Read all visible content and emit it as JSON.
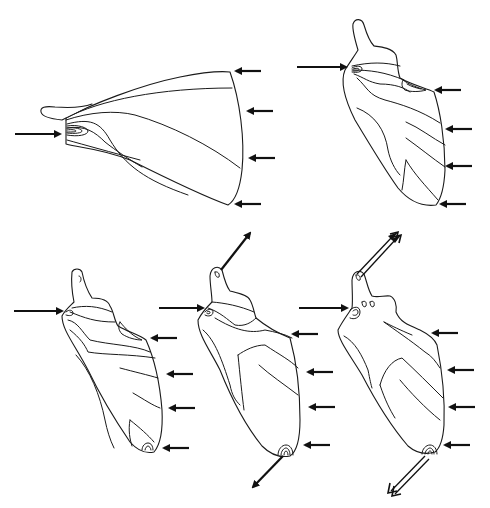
{
  "diagram": {
    "type": "line-art illustration",
    "background": "#ffffff",
    "stroke_color": "#1a1a1a",
    "arrow_color": "#111111",
    "figures": [
      {
        "id": "figure-1",
        "position": "top-left",
        "orientation": "horizontal fan",
        "arrows": [
          {
            "kind": "single",
            "direction": "right",
            "points_to": "apex concentric contours"
          },
          {
            "kind": "single",
            "direction": "left",
            "points_to": "right edge top"
          },
          {
            "kind": "single",
            "direction": "left",
            "points_to": "right edge upper-middle"
          },
          {
            "kind": "single",
            "direction": "left",
            "points_to": "right edge lower-middle"
          },
          {
            "kind": "single",
            "direction": "left",
            "points_to": "right edge bottom"
          }
        ]
      },
      {
        "id": "figure-2",
        "position": "top-right",
        "orientation": "vertical blade",
        "arrows": [
          {
            "kind": "single",
            "direction": "right",
            "points_to": "upper-left concentric contours"
          },
          {
            "kind": "single",
            "direction": "left",
            "points_to": "upper-right concentric contours"
          },
          {
            "kind": "single",
            "direction": "left",
            "points_to": "right edge middle"
          },
          {
            "kind": "single",
            "direction": "left",
            "points_to": "right edge lower"
          },
          {
            "kind": "single",
            "direction": "left",
            "points_to": "bottom tip"
          }
        ]
      },
      {
        "id": "figure-3",
        "position": "bottom-left",
        "orientation": "vertical blade",
        "arrows": [
          {
            "kind": "single",
            "direction": "right",
            "points_to": "upper-left small contour"
          },
          {
            "kind": "single",
            "direction": "left",
            "points_to": "upper-right notch"
          },
          {
            "kind": "single",
            "direction": "left",
            "points_to": "right edge middle"
          },
          {
            "kind": "single",
            "direction": "left",
            "points_to": "right edge lower"
          },
          {
            "kind": "single",
            "direction": "left",
            "points_to": "bottom tip contour"
          }
        ]
      },
      {
        "id": "figure-4",
        "position": "bottom-center",
        "orientation": "vertical blade",
        "arrows": [
          {
            "kind": "single",
            "direction": "up-right",
            "points_to": "away from top process tip"
          },
          {
            "kind": "single",
            "direction": "right",
            "points_to": "upper-left small contour"
          },
          {
            "kind": "single",
            "direction": "left",
            "points_to": "upper-right shoulder"
          },
          {
            "kind": "single",
            "direction": "left",
            "points_to": "right edge middle"
          },
          {
            "kind": "single",
            "direction": "left",
            "points_to": "right edge lower"
          },
          {
            "kind": "single",
            "direction": "left",
            "points_to": "bottom tip contour"
          },
          {
            "kind": "single",
            "direction": "down-left",
            "points_to": "away from bottom tip"
          }
        ]
      },
      {
        "id": "figure-5",
        "position": "bottom-right",
        "orientation": "vertical blade",
        "arrows": [
          {
            "kind": "double-line",
            "direction": "up-right",
            "points_to": "away from top process tip"
          },
          {
            "kind": "single",
            "direction": "right",
            "points_to": "upper-left concentric contour"
          },
          {
            "kind": "single",
            "direction": "left",
            "points_to": "upper-right shoulder"
          },
          {
            "kind": "single",
            "direction": "left",
            "points_to": "right edge middle"
          },
          {
            "kind": "single",
            "direction": "left",
            "points_to": "right edge lower"
          },
          {
            "kind": "single",
            "direction": "left",
            "points_to": "bottom tip contour"
          },
          {
            "kind": "double-line",
            "direction": "down-left",
            "points_to": "away from bottom tip"
          }
        ]
      }
    ]
  }
}
